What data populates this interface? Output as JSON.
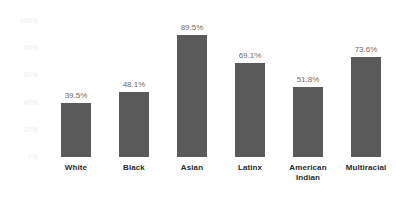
{
  "chart_data": {
    "type": "bar",
    "title": "",
    "subtitle": "",
    "xlabel": "",
    "ylabel": "",
    "ylim": [
      0,
      100
    ],
    "grid": false,
    "legend": "none",
    "value_suffix": "%",
    "bar_color": "#5a5a5a",
    "axis_label_color": "#ededed",
    "value_label_color": "#6d6d6d",
    "category_label_color": "#2b2b2b",
    "background_color": "#ffffff",
    "categories": [
      "White",
      "Black",
      "Asian",
      "Latinx",
      "American Indian",
      "Multiracial"
    ],
    "category_lines": [
      [
        "White"
      ],
      [
        "Black"
      ],
      [
        "Asian"
      ],
      [
        "Latinx"
      ],
      [
        "American",
        "Indian"
      ],
      [
        "Multiracial"
      ]
    ],
    "values": [
      39.5,
      48.1,
      89.5,
      69.1,
      51.8,
      73.6
    ],
    "value_labels": [
      "39.5%",
      "48.1%",
      "89.5%",
      "69.1%",
      "51.8%",
      "73.6%"
    ],
    "yticks": [
      0,
      20,
      40,
      60,
      80,
      100
    ],
    "ytick_labels": [
      "0%",
      "20%",
      "40%",
      "60%",
      "80%",
      "100%"
    ]
  }
}
